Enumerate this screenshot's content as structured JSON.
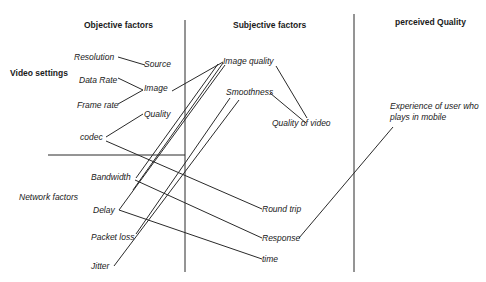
{
  "headers": {
    "objective": "Objective factors",
    "subjective": "Subjective factors",
    "perceived": "perceived Quality"
  },
  "groups": {
    "video_settings": "Video settings",
    "network_factors": "Network factors"
  },
  "objective_inputs": {
    "resolution": "Resolution",
    "data_rate": "Data Rate",
    "frame_rate": "Frame rate",
    "codec": "codec"
  },
  "objective_derived": {
    "source": "Source",
    "image": "Image",
    "quality": "Quality"
  },
  "network_inputs": {
    "bandwidth": "Bandwidth",
    "delay": "Delay",
    "packet_loss": "Packet loss",
    "jitter": "Jitter"
  },
  "subjective_nodes": {
    "image_quality": "Image quality",
    "smoothness": "Smoothness",
    "quality_of_video": "Quality of video",
    "round_trip": "Round trip",
    "response": "Response",
    "time": "time"
  },
  "perceived_nodes": {
    "experience": "Experience of user who plays in mobile"
  },
  "colors": {
    "line": "#2a2a2a",
    "text": "#1a1a1a",
    "background": "#ffffff"
  }
}
